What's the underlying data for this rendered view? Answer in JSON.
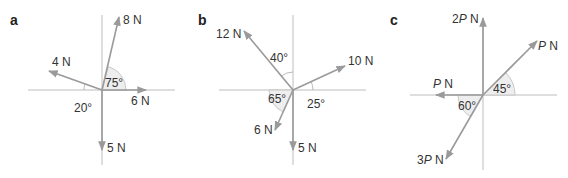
{
  "figure": {
    "colors": {
      "axis": "#bdbdbd",
      "force": "#9a9a9a",
      "text": "#333333",
      "angle_fill": "#eeeeee"
    },
    "panels": [
      {
        "id": "a",
        "label": "a",
        "forces": [
          {
            "label": "8 N",
            "direction_deg": 75
          },
          {
            "label": "4 N",
            "direction_deg": 160
          },
          {
            "label": "6 N",
            "direction_deg": 0
          },
          {
            "label": "5 N",
            "direction_deg": 270
          }
        ],
        "angles": [
          {
            "label": "75°",
            "between": "6 N and 8 N"
          },
          {
            "label": "20°",
            "between": "4 N and negative x-axis"
          }
        ]
      },
      {
        "id": "b",
        "label": "b",
        "forces": [
          {
            "label": "12 N",
            "direction_deg": 130
          },
          {
            "label": "10 N",
            "direction_deg": 25
          },
          {
            "label": "6 N",
            "direction_deg": 245
          },
          {
            "label": "5 N",
            "direction_deg": 270
          }
        ],
        "angles": [
          {
            "label": "40°",
            "between": "12 N and positive y-axis"
          },
          {
            "label": "25°",
            "between": "10 N and positive x-axis"
          },
          {
            "label": "65°",
            "between": "6 N and negative x-axis"
          }
        ]
      },
      {
        "id": "c",
        "label": "c",
        "forces": [
          {
            "label": "2P N",
            "coef": "2",
            "var": "P",
            "unit": " N",
            "direction_deg": 90
          },
          {
            "label": "P N",
            "coef": "",
            "var": "P",
            "unit": " N",
            "direction_deg": 45
          },
          {
            "label": "P N",
            "coef": "",
            "var": "P",
            "unit": " N",
            "direction_deg": 180
          },
          {
            "label": "3P N",
            "coef": "3",
            "var": "P",
            "unit": " N",
            "direction_deg": 240
          }
        ],
        "angles": [
          {
            "label": "45°",
            "between": "P N and positive x-axis"
          },
          {
            "label": "60°",
            "between": "3P N and negative x-axis"
          }
        ]
      }
    ]
  }
}
